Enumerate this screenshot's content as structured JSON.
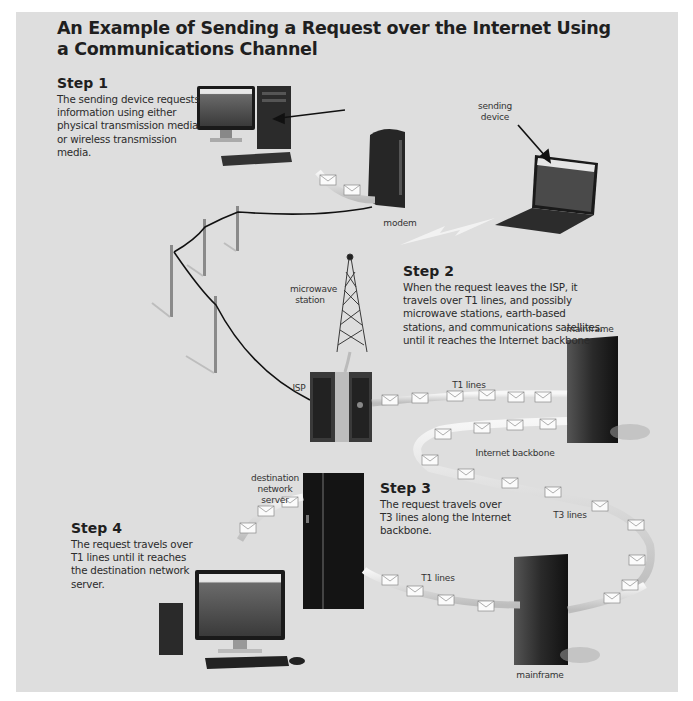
{
  "figure": {
    "title": "An Example of Sending a Request over the Internet Using a Communications Channel",
    "background_color": "#dedede",
    "text_color": "#1f1f1f"
  },
  "steps": [
    {
      "heading": "Step 1",
      "text": "The sending device requests information using either physical transmission media or wireless transmission media."
    },
    {
      "heading": "Step 2",
      "text": "When the request leaves the ISP, it travels over T1 lines, and possibly microwave stations, earth-based stations, and communications satellites, until it reaches the Internet backbone."
    },
    {
      "heading": "Step 3",
      "text": "The request travels over T3 lines along the Internet backbone."
    },
    {
      "heading": "Step 4",
      "text": "The request travels over T1 lines until it reaches the destination network server."
    }
  ],
  "labels": {
    "sending_device": "sending device",
    "modem": "modem",
    "microwave_station": "microwave station",
    "isp": "ISP",
    "t1_lines_top": "T1 lines",
    "mainframe_top": "mainframe",
    "internet_backbone": "Internet backbone",
    "t3_lines": "T3 lines",
    "destination_network_server": "destination network server",
    "t1_lines_bottom": "T1 lines",
    "mainframe_bottom": "mainframe"
  },
  "nodes": [
    {
      "id": "desktop-sender",
      "type": "desktop computer"
    },
    {
      "id": "laptop-sender",
      "type": "laptop"
    },
    {
      "id": "modem",
      "type": "modem"
    },
    {
      "id": "utility-poles",
      "type": "physical transmission lines"
    },
    {
      "id": "microwave-tower",
      "type": "microwave station"
    },
    {
      "id": "isp-server",
      "type": "ISP server"
    },
    {
      "id": "mainframe-top",
      "type": "mainframe"
    },
    {
      "id": "destination-server",
      "type": "destination network server"
    },
    {
      "id": "mainframe-bottom",
      "type": "mainframe"
    },
    {
      "id": "desktop-destination",
      "type": "desktop computer"
    }
  ]
}
